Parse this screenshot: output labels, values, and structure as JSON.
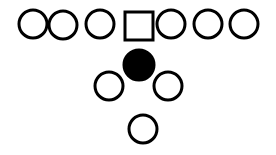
{
  "diagram": {
    "type": "formation",
    "colors": {
      "stroke": "#000000",
      "fill": "#ffffff",
      "filled": "#000000"
    },
    "stroke_width": 3,
    "line": [
      {
        "shape": "circle",
        "cx": 33,
        "cy": 24,
        "r": 14
      },
      {
        "shape": "circle",
        "cx": 63,
        "cy": 25,
        "r": 14
      },
      {
        "shape": "circle",
        "cx": 100,
        "cy": 24,
        "r": 14
      },
      {
        "shape": "square",
        "x": 125,
        "y": 12,
        "w": 28,
        "h": 28
      },
      {
        "shape": "circle",
        "cx": 171,
        "cy": 24,
        "r": 14
      },
      {
        "shape": "circle",
        "cx": 208,
        "cy": 24,
        "r": 14
      },
      {
        "shape": "circle",
        "cx": 244,
        "cy": 24,
        "r": 14
      }
    ],
    "backfield": [
      {
        "shape": "filled-circle",
        "cx": 139,
        "cy": 65,
        "r": 15
      },
      {
        "shape": "circle",
        "cx": 109,
        "cy": 86,
        "r": 14
      },
      {
        "shape": "circle",
        "cx": 168,
        "cy": 86,
        "r": 14
      },
      {
        "shape": "circle",
        "cx": 143,
        "cy": 129,
        "r": 14
      }
    ]
  }
}
